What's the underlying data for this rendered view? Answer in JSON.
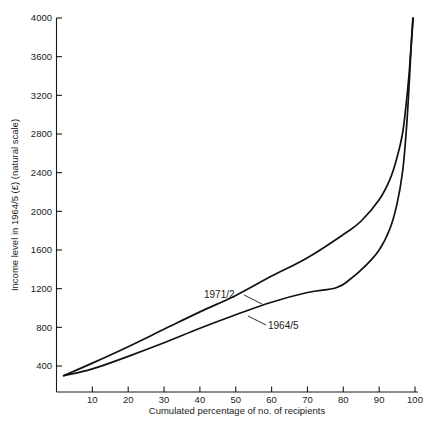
{
  "chart_data": {
    "type": "line",
    "title": "",
    "xlabel": "Cumulated percentage of no. of recipients",
    "ylabel": "Income level in 1964/5 (£) (natural scale)",
    "xlim": [
      0,
      100
    ],
    "ylim": [
      140,
      4000
    ],
    "grid": false,
    "legend_position": "inline-annotations",
    "xticks": [
      10,
      20,
      30,
      40,
      50,
      60,
      70,
      80,
      90,
      100
    ],
    "xtick_labels": [
      "10",
      "20",
      "30",
      "40",
      "50",
      "60",
      "70",
      "80",
      "90",
      "100"
    ],
    "yticks": [
      400,
      800,
      1200,
      1600,
      2000,
      2400,
      2800,
      3200,
      3600,
      4000
    ],
    "ytick_labels": [
      "400",
      "800",
      "1200",
      "1600",
      "2000",
      "2400",
      "2800",
      "3200",
      "3600",
      "4000"
    ],
    "series": [
      {
        "name": "1971/2",
        "label": "1971/2",
        "color": "#111111",
        "x": [
          2,
          10,
          20,
          30,
          40,
          50,
          60,
          70,
          80,
          85,
          90,
          93,
          95,
          96.5,
          97.5,
          98.3,
          98.8,
          99.2,
          99.5
        ],
        "values": [
          300,
          430,
          600,
          780,
          960,
          1130,
          1330,
          1520,
          1760,
          1900,
          2120,
          2330,
          2560,
          2800,
          3100,
          3400,
          3650,
          3850,
          4000
        ]
      },
      {
        "name": "1964/5",
        "label": "1964/5",
        "color": "#111111",
        "x": [
          2,
          10,
          20,
          30,
          40,
          50,
          60,
          70,
          78,
          82,
          86,
          90,
          93,
          95,
          96.5,
          97.5,
          98.2,
          98.7,
          99.1,
          99.4
        ],
        "values": [
          300,
          370,
          500,
          640,
          790,
          930,
          1060,
          1160,
          1210,
          1300,
          1430,
          1600,
          1820,
          2080,
          2400,
          2800,
          3200,
          3550,
          3820,
          4000
        ]
      }
    ],
    "annotations": [
      {
        "text": "1971/2",
        "series": "1971/2"
      },
      {
        "text": "1964/5",
        "series": "1964/5"
      }
    ]
  }
}
